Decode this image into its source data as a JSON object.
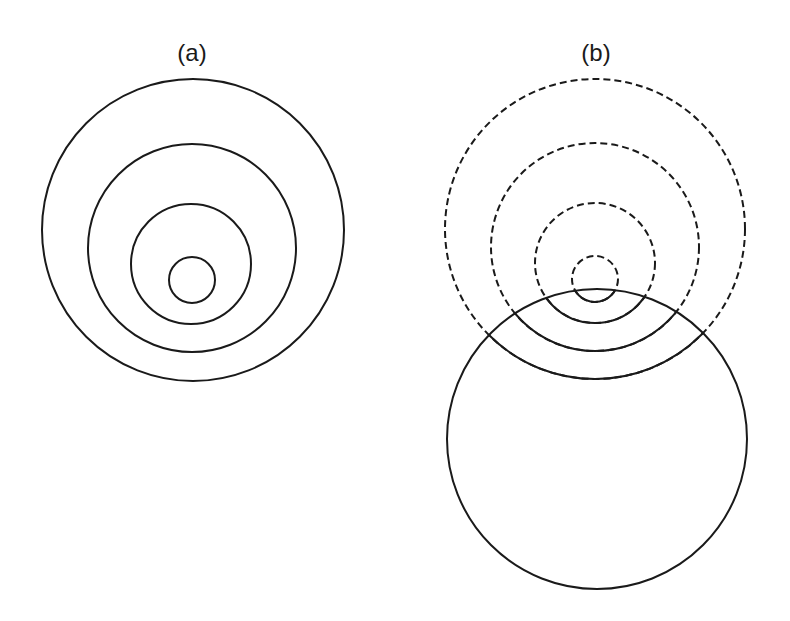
{
  "panels": [
    {
      "id": "a",
      "label": "(a)",
      "label_pos": {
        "x": 192,
        "y": 61
      },
      "circles": [
        {
          "cx": 193,
          "cy": 230,
          "r": 151,
          "style": "solid"
        },
        {
          "cx": 192,
          "cy": 248,
          "r": 104,
          "style": "solid"
        },
        {
          "cx": 191,
          "cy": 264,
          "r": 60,
          "style": "solid"
        },
        {
          "cx": 192,
          "cy": 280,
          "r": 23,
          "style": "solid"
        }
      ]
    },
    {
      "id": "b",
      "label": "(b)",
      "label_pos": {
        "x": 596,
        "y": 61
      },
      "dashed_circles": [
        {
          "cx": 595,
          "cy": 229,
          "r": 150
        },
        {
          "cx": 595,
          "cy": 247,
          "r": 104
        },
        {
          "cx": 595,
          "cy": 263,
          "r": 60
        },
        {
          "cx": 595,
          "cy": 279,
          "r": 23
        }
      ],
      "solid_circle": {
        "cx": 597,
        "cy": 439,
        "r": 150
      },
      "note": "dashed circles become solid inside the solid circle"
    }
  ],
  "colors": {
    "stroke": "#1a1a1a",
    "background": "#ffffff"
  }
}
